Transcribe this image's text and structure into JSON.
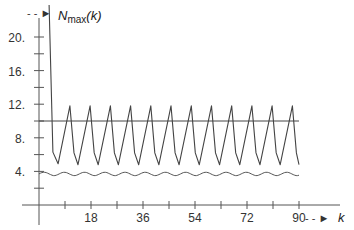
{
  "chart_data": {
    "type": "line",
    "title": "",
    "xlabel": "k",
    "ylabel": "N_max(k)",
    "ylabel_parts": {
      "main": "N",
      "sub": "max",
      "arg": "(k)"
    },
    "xlim": [
      0,
      90
    ],
    "ylim": [
      0,
      22
    ],
    "x_ticks": [
      9,
      18,
      27,
      36,
      45,
      54,
      63,
      72,
      81,
      90
    ],
    "x_tick_labels": [
      {
        "value": 18,
        "label": "18"
      },
      {
        "value": 36,
        "label": "36"
      },
      {
        "value": 54,
        "label": "54"
      },
      {
        "value": 72,
        "label": "72"
      },
      {
        "value": 90,
        "label": "90"
      }
    ],
    "y_ticks": [
      2,
      4,
      6,
      8,
      10,
      12,
      14,
      16,
      18,
      20
    ],
    "y_tick_labels": [
      {
        "value": 4,
        "label": "4."
      },
      {
        "value": 8,
        "label": "8."
      },
      {
        "value": 12,
        "label": "12."
      },
      {
        "value": 16,
        "label": "16."
      },
      {
        "value": 20,
        "label": "20."
      }
    ],
    "grid": false,
    "legend": null,
    "series": [
      {
        "name": "N_max(k) sawtooth",
        "style": "solid",
        "color": "#444444",
        "x": [
          3.5,
          4.8,
          6.6,
          10.7,
          12.1,
          13.5,
          17.7,
          19.1,
          20.5,
          24.7,
          26.1,
          27.5,
          31.7,
          33.1,
          34.5,
          38.7,
          40.1,
          41.5,
          45.7,
          47.1,
          48.5,
          52.7,
          54.1,
          55.5,
          59.7,
          61.1,
          62.5,
          66.7,
          68.1,
          69.5,
          73.7,
          75.1,
          76.5,
          80.7,
          82.1,
          83.5,
          87.7,
          89.1,
          90.0
        ],
        "y": [
          23.8,
          6.3,
          4.9,
          11.8,
          6.2,
          4.8,
          11.8,
          6.2,
          4.8,
          11.8,
          6.2,
          4.8,
          11.8,
          6.2,
          4.8,
          11.8,
          6.2,
          4.8,
          11.8,
          6.2,
          4.8,
          11.8,
          6.2,
          4.8,
          11.8,
          6.2,
          4.8,
          11.8,
          6.2,
          4.8,
          11.8,
          6.2,
          4.8,
          11.8,
          6.2,
          4.8,
          11.8,
          6.2,
          4.8
        ]
      },
      {
        "name": "threshold",
        "style": "solid",
        "color": "#444444",
        "x": [
          0,
          90
        ],
        "y": [
          10,
          10
        ]
      },
      {
        "name": "lower bound (wavy)",
        "style": "solid",
        "color": "#555555",
        "x": [
          0,
          90
        ],
        "y_mean": 3.7,
        "y_amplitude": 0.2,
        "wave_period_k": 7
      }
    ],
    "annotations": [
      {
        "text": "--►",
        "near": "y-axis top, pointing to curve"
      },
      {
        "text": "--► k",
        "near": "x-axis right end"
      }
    ]
  },
  "labels": {
    "y_axis_main": "N",
    "y_axis_sub": "max",
    "y_axis_arg": "(k)",
    "x_axis": "k",
    "arrow_y": "- - ►",
    "arrow_x": "- - ►"
  }
}
